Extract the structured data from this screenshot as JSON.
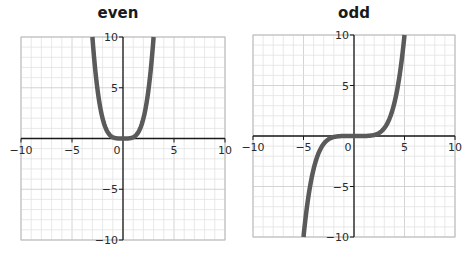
{
  "chart_data": [
    {
      "type": "line",
      "title": "even",
      "xlabel": "",
      "ylabel": "",
      "xlim": [
        -10,
        10
      ],
      "ylim": [
        -10,
        10
      ],
      "grid": true,
      "x_ticks": [
        "-10",
        "-5",
        "0",
        "5",
        "10"
      ],
      "y_ticks": [
        "10",
        "5",
        "-5",
        "-10"
      ],
      "series": [
        {
          "name": "even function (y = x^4/8 approx)",
          "x": [
            -3,
            -2.5,
            -2,
            -1.5,
            -1,
            -0.5,
            0,
            0.5,
            1,
            1.5,
            2,
            2.5,
            3
          ],
          "y": [
            10,
            4.9,
            2,
            0.63,
            0.13,
            0.01,
            0,
            0.01,
            0.13,
            0.63,
            2,
            4.9,
            10
          ]
        }
      ],
      "color": "#5a5a5a"
    },
    {
      "type": "line",
      "title": "odd",
      "xlabel": "",
      "ylabel": "",
      "xlim": [
        -10,
        10
      ],
      "ylim": [
        -10,
        10
      ],
      "grid": true,
      "x_ticks": [
        "-10",
        "-5",
        "0",
        "5",
        "10"
      ],
      "y_ticks": [
        "10",
        "5",
        "-5",
        "-10"
      ],
      "series": [
        {
          "name": "odd function (y = x^5/312 approx)",
          "x": [
            -5,
            -4.5,
            -4,
            -3.5,
            -3,
            -2.5,
            -2,
            -1.5,
            -1,
            -0.5,
            0,
            0.5,
            1,
            1.5,
            2,
            2.5,
            3,
            3.5,
            4,
            4.5,
            5
          ],
          "y": [
            -10,
            -5.9,
            -3.3,
            -1.7,
            -0.8,
            -0.3,
            -0.1,
            -0.02,
            0,
            0,
            0,
            0,
            0,
            0.02,
            0.1,
            0.3,
            0.8,
            1.7,
            3.3,
            5.9,
            10
          ]
        }
      ],
      "color": "#5a5a5a"
    }
  ],
  "panels": {
    "left": {
      "title": "even"
    },
    "right": {
      "title": "odd"
    }
  },
  "ticks": {
    "x": [
      "−10",
      "−5",
      "0",
      "5",
      "10"
    ],
    "y_pos": [
      "10",
      "5"
    ],
    "y_neg": [
      "−5",
      "−10"
    ]
  }
}
